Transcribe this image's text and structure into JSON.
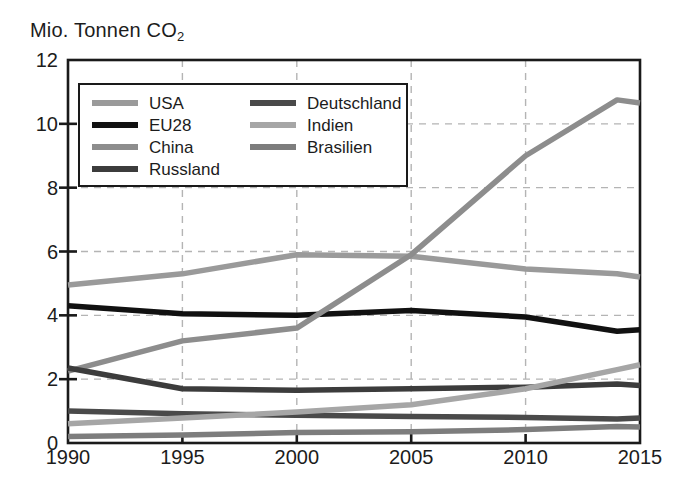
{
  "chart_data": {
    "type": "line",
    "title": "Mio. Tonnen CO2",
    "ylabel": "Mio. Tonnen CO2",
    "xlabel": "",
    "x": [
      1990,
      1995,
      2000,
      2005,
      2010,
      2014,
      2015
    ],
    "xlim": [
      1990,
      2015
    ],
    "ylim": [
      0,
      12
    ],
    "xticks": [
      "1990",
      "1995",
      "2000",
      "2005",
      "2010",
      "2015"
    ],
    "yticks": [
      "0",
      "2",
      "4",
      "6",
      "8",
      "10",
      "12"
    ],
    "grid": "dashed gridlines at x ticks and y ticks",
    "legend_position": "upper-left inside plot area",
    "series": [
      {
        "name": "USA",
        "color": "#9a9a9a",
        "values": [
          4.95,
          5.3,
          5.9,
          5.85,
          5.45,
          5.3,
          5.2
        ]
      },
      {
        "name": "EU28",
        "color": "#111111",
        "values": [
          4.3,
          4.05,
          4.0,
          4.15,
          3.95,
          3.5,
          3.55
        ]
      },
      {
        "name": "China",
        "color": "#8d8d8d",
        "values": [
          2.25,
          3.2,
          3.6,
          5.9,
          9.0,
          10.75,
          10.65
        ]
      },
      {
        "name": "Russland",
        "color": "#3c3c3c",
        "values": [
          2.35,
          1.7,
          1.65,
          1.7,
          1.75,
          1.85,
          1.8
        ]
      },
      {
        "name": "Deutschland",
        "color": "#4a4a4a",
        "values": [
          1.0,
          0.92,
          0.87,
          0.83,
          0.8,
          0.75,
          0.78
        ]
      },
      {
        "name": "Indien",
        "color": "#a6a6a6",
        "values": [
          0.6,
          0.78,
          0.97,
          1.2,
          1.7,
          2.3,
          2.45
        ]
      },
      {
        "name": "Brasilien",
        "color": "#7d7d7d",
        "values": [
          0.2,
          0.25,
          0.33,
          0.35,
          0.42,
          0.52,
          0.5
        ]
      }
    ]
  },
  "legend": {
    "left_column": [
      "USA",
      "EU28",
      "China",
      "Russland"
    ],
    "right_column": [
      "Deutschland",
      "Indien",
      "Brasilien"
    ]
  },
  "axes": {
    "y_title_main": "Mio. Tonnen CO",
    "y_title_sub": "2"
  },
  "colors": {
    "axis": "#1a1a1a",
    "grid": "#b4b4b4",
    "background": "#ffffff"
  }
}
